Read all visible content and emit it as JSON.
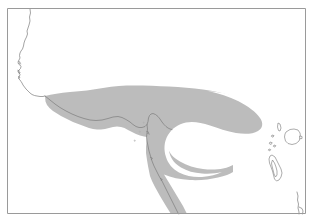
{
  "figure": {
    "kind": "distribution-range-map",
    "title": "",
    "caption": "",
    "width_px": 313,
    "height_px": 224,
    "background_color": "#ffffff"
  },
  "frame": {
    "border_color": "#9a9a9a",
    "x": 7,
    "y": 8,
    "width": 299,
    "height": 206
  },
  "legend": {
    "visible": false,
    "entries": [
      {
        "label": "",
        "swatch_color": "#bcbcbc"
      }
    ]
  },
  "layers": {
    "range": {
      "name": "shaded-range-area",
      "fill_color": "#bcbcbc",
      "outline_color": "none",
      "description": "shaded band following the north coast, hooking east and curving back west into a C-shaped notch"
    },
    "coastline": {
      "name": "coastline",
      "stroke_color": "#7d7d7d",
      "stroke_width": 0.7
    },
    "islands": {
      "name": "offshore-islands",
      "fill_color": "#ffffff",
      "stroke_color": "#8a8a8a",
      "count": 8
    }
  },
  "annotations": {
    "scale_bar": "",
    "north_arrow": "",
    "axis_labels": []
  },
  "chart_data": {
    "type": "map",
    "title": "",
    "projection": "equirectangular",
    "grid": false,
    "legend_position": "none",
    "features": {
      "range_polygon_extent": {
        "x_min": 45,
        "x_max": 273,
        "y_min": 85,
        "y_max": 214
      },
      "coastline_extent": {
        "x_min": 8,
        "x_max": 306,
        "y_min": 9,
        "y_max": 214
      },
      "island_count": 8
    }
  }
}
